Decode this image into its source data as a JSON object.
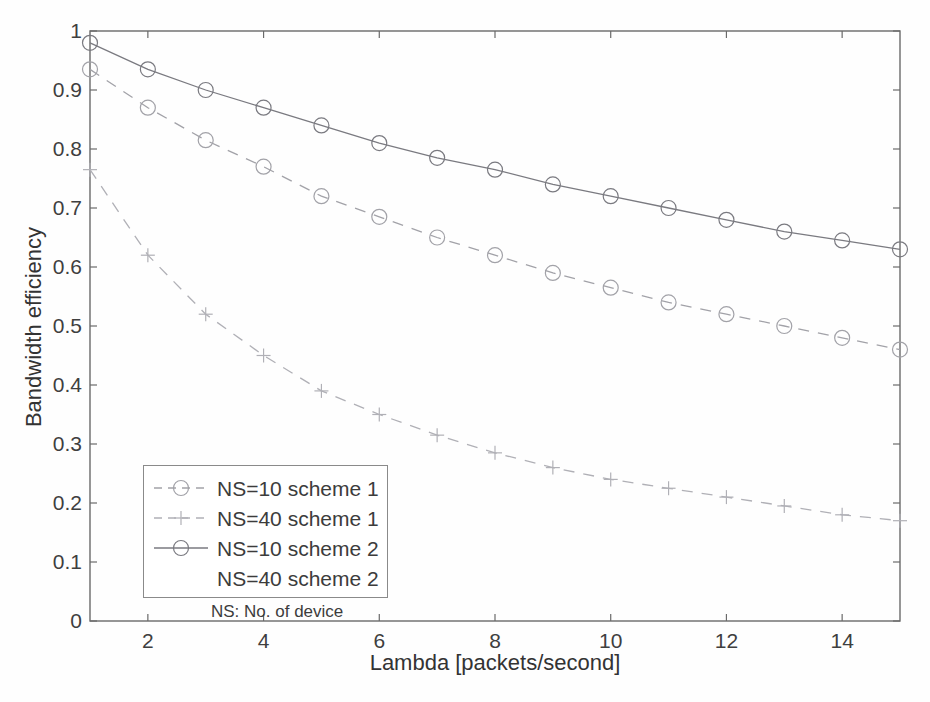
{
  "figure": {
    "background": "#fefefe",
    "axis_color": "#6a6a6a",
    "text_color": "#3f3f3f"
  },
  "chart_data": {
    "type": "line",
    "title": "",
    "xlabel": "Lambda [packets/second]",
    "ylabel": "Bandwidth efficiency",
    "xlim": [
      1,
      15
    ],
    "ylim": [
      0,
      1
    ],
    "x_ticks": [
      2,
      4,
      6,
      8,
      10,
      12,
      14
    ],
    "x_tick_labels": [
      "2",
      "4",
      "6",
      "8",
      "10",
      "12",
      "14"
    ],
    "y_ticks": [
      0,
      0.1,
      0.2,
      0.3,
      0.4,
      0.5,
      0.6,
      0.7,
      0.8,
      0.9,
      1
    ],
    "y_tick_labels": [
      "0",
      "0.1",
      "0.2",
      "0.3",
      "0.4",
      "0.5",
      "0.6",
      "0.7",
      "0.8",
      "0.9",
      "1"
    ],
    "grid": false,
    "frame": true,
    "x": [
      1,
      2,
      3,
      4,
      5,
      6,
      7,
      8,
      9,
      10,
      11,
      12,
      13,
      14,
      15
    ],
    "series": [
      {
        "name": "NS=10 scheme 1",
        "line": "dashed",
        "marker": "circle",
        "color": "#a2a2a8",
        "values": [
          0.935,
          0.87,
          0.815,
          0.77,
          0.72,
          0.685,
          0.65,
          0.62,
          0.59,
          0.565,
          0.54,
          0.52,
          0.5,
          0.48,
          0.46
        ]
      },
      {
        "name": "NS=40 scheme 1",
        "line": "dashed",
        "marker": "plus",
        "color": "#b0b0b6",
        "values": [
          0.765,
          0.62,
          0.52,
          0.45,
          0.39,
          0.35,
          0.315,
          0.285,
          0.26,
          0.24,
          0.225,
          0.21,
          0.195,
          0.18,
          0.17
        ]
      },
      {
        "name": "NS=10 scheme 2",
        "line": "solid",
        "marker": "circle",
        "color": "#7a7a80",
        "values": [
          0.98,
          0.935,
          0.9,
          0.87,
          0.84,
          0.81,
          0.785,
          0.765,
          0.74,
          0.72,
          0.7,
          0.68,
          0.66,
          0.645,
          0.63
        ]
      }
    ],
    "legend": {
      "position": "lower-left-inside",
      "items": [
        {
          "label": "NS=10 scheme 1",
          "line": "dashed",
          "marker": "circle",
          "color": "#a2a2a8"
        },
        {
          "label": "NS=40 scheme 1",
          "line": "dashed",
          "marker": "plus",
          "color": "#b0b0b6"
        },
        {
          "label": "NS=10 scheme 2",
          "line": "solid",
          "marker": "circle",
          "color": "#7a7a80"
        },
        {
          "label": "NS=40 scheme 2",
          "line": "none",
          "marker": "none",
          "color": ""
        }
      ],
      "note": "NS: No. of device"
    }
  }
}
